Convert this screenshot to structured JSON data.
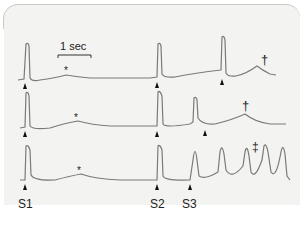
{
  "figure": {
    "scale_bar_label": "1 sec",
    "stimulus_labels": {
      "s1": "S1",
      "s2": "S2",
      "s3": "S3"
    },
    "annotations": {
      "star": "*",
      "dagger": "†",
      "double_dagger": "‡"
    },
    "colors": {
      "trace": "#7a7a7a",
      "marker": "#111111",
      "panel_bg": "#f3f3f1"
    },
    "rows": [
      {
        "name": "trace-1",
        "description": "S1 response followed by S2 and a late triggered beat with dagger bump"
      },
      {
        "name": "trace-2",
        "description": "S1 response followed by S2 and earlier triggered beat with dagger bump"
      },
      {
        "name": "trace-3",
        "description": "S1 response followed by S2, S3 and sustained repetitive firing (double dagger)"
      }
    ]
  }
}
